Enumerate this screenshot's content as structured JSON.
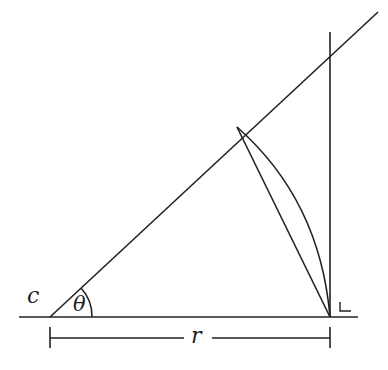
{
  "diagram": {
    "type": "geometry",
    "labels": {
      "vertex": "c",
      "angle": "θ",
      "adjacent_side": "r",
      "right_angle_mark": "∟"
    },
    "stroke_color": "#222222",
    "background": "#ffffff"
  }
}
